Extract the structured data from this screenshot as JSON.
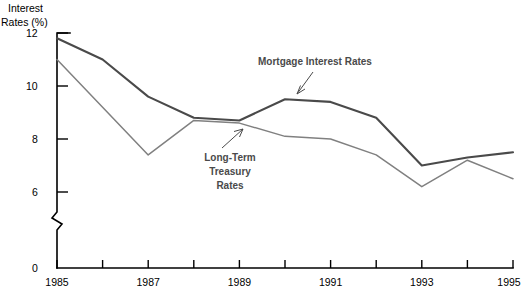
{
  "chart_data": {
    "type": "line",
    "title": "",
    "xlabel": "",
    "ylabel": "Interest Rates (%)",
    "ylabel_line1": "Interest",
    "ylabel_line2": "Rates (%)",
    "x": [
      1985,
      1986,
      1987,
      1988,
      1989,
      1990,
      1991,
      1992,
      1993,
      1994,
      1995
    ],
    "xlim": [
      1985,
      1995
    ],
    "ylim": [
      6,
      12
    ],
    "y_ticks": [
      12,
      10,
      8,
      6,
      0
    ],
    "y_tick_labels": [
      "12",
      "10",
      "8",
      "6",
      "0"
    ],
    "x_ticks": [
      1985,
      1986,
      1987,
      1988,
      1989,
      1990,
      1991,
      1992,
      1993,
      1994,
      1995
    ],
    "x_tick_labels": [
      "1985",
      "",
      "1987",
      "",
      "1989",
      "",
      "1991",
      "",
      "1993",
      "",
      "1995"
    ],
    "axis_break": true,
    "grid": false,
    "legend_position": "inline-annotations",
    "series": [
      {
        "name": "Mortgage Interest Rates",
        "color": "#4a4a4a",
        "values": [
          11.8,
          11.0,
          9.6,
          8.8,
          8.7,
          9.5,
          9.4,
          8.8,
          7.0,
          7.3,
          7.5
        ]
      },
      {
        "name": "Long-Term Treasury Rates",
        "color": "#808080",
        "values": [
          11.0,
          9.2,
          7.4,
          8.7,
          8.6,
          8.1,
          8.0,
          7.4,
          6.2,
          7.2,
          6.5
        ]
      }
    ],
    "annotations": [
      {
        "id": "mortgage-annotation",
        "text": "Mortgage Interest Rates",
        "lines": [
          "Mortgage Interest Rates"
        ],
        "target_x": 1990,
        "target_y": 9.5
      },
      {
        "id": "treasury-annotation",
        "text": "Long-Term Treasury Rates",
        "lines": [
          "Long-Term",
          "Treasury",
          "Rates"
        ],
        "target_x": 1989.6,
        "target_y": 8.3
      }
    ]
  }
}
